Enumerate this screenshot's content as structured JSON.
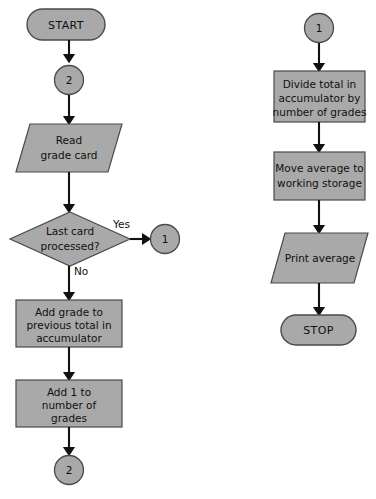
{
  "diagram": {
    "background_color": "#ffffff",
    "shape_fill_color": "#a9a9a9",
    "shape_stroke_color": "#4a4a4a",
    "line_color": "#111111",
    "text_color": "#101010"
  },
  "left_column": {
    "start": {
      "label": "START",
      "shape": "terminator"
    },
    "connector_in": {
      "label": "2",
      "shape": "connector-circle"
    },
    "read_card": {
      "line1": "Read",
      "line2": "grade card",
      "shape": "input-output-parallelogram"
    },
    "decision": {
      "line1": "Last card",
      "line2": "processed?",
      "shape": "decision-diamond"
    },
    "branch_yes": {
      "label": "Yes"
    },
    "branch_no": {
      "label": "No"
    },
    "connector_yes_target": {
      "label": "1",
      "shape": "connector-circle"
    },
    "add_grade": {
      "line1": "Add grade to",
      "line2": "previous total in",
      "line3": "accumulator",
      "shape": "process-rectangle"
    },
    "add_one": {
      "line1": "Add 1 to",
      "line2": "number of",
      "line3": "grades",
      "shape": "process-rectangle"
    },
    "connector_out": {
      "label": "2",
      "shape": "connector-circle"
    }
  },
  "right_column": {
    "connector_in": {
      "label": "1",
      "shape": "connector-circle"
    },
    "divide_total": {
      "line1": "Divide total in",
      "line2": "accumulator by",
      "line3": "number of grades",
      "shape": "process-rectangle"
    },
    "move_average": {
      "line1": "Move average to",
      "line2": "working storage",
      "shape": "process-rectangle"
    },
    "print_average": {
      "line1": "Print average",
      "shape": "input-output-parallelogram"
    },
    "stop": {
      "label": "STOP",
      "shape": "terminator"
    }
  }
}
